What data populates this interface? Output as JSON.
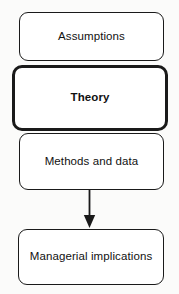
{
  "diagram": {
    "type": "flowchart",
    "orientation": "vertical",
    "background_color": "#fbfbfa",
    "stroke_color": "#1a1a1a",
    "fill_color": "#ffffff",
    "nodes": [
      {
        "id": "assumptions",
        "label": "Assumptions",
        "emphasis": "normal",
        "shape": "rounded-rectangle"
      },
      {
        "id": "theory",
        "label": "Theory",
        "emphasis": "bold",
        "shape": "rounded-rectangle"
      },
      {
        "id": "methods",
        "label": "Methods and data",
        "emphasis": "normal",
        "shape": "rounded-rectangle"
      },
      {
        "id": "implications",
        "label": "Managerial implications",
        "emphasis": "normal",
        "shape": "rounded-rectangle"
      }
    ],
    "edges": [
      {
        "id": "methods-to-implications",
        "from": "methods",
        "to": "implications",
        "style": "solid",
        "arrowhead": "filled-triangle",
        "label": ""
      }
    ]
  }
}
